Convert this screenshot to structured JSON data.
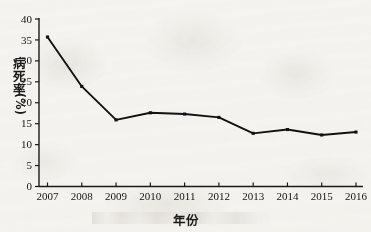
{
  "chart_data": {
    "type": "line",
    "title": "",
    "subtitle": "",
    "xlabel": "年份",
    "ylabel": "病死率(%)",
    "ylabel_chars": [
      "病",
      "死",
      "率"
    ],
    "ylabel_unit": "(%)",
    "categories": [
      "2007",
      "2008",
      "2009",
      "2010",
      "2011",
      "2012",
      "2013",
      "2014",
      "2015",
      "2016"
    ],
    "values": [
      35.7,
      23.9,
      15.9,
      17.6,
      17.3,
      16.5,
      12.7,
      13.6,
      12.3,
      13.0
    ],
    "series": [
      {
        "name": "病死率",
        "values": [
          35.7,
          23.9,
          15.9,
          17.6,
          17.3,
          16.5,
          12.7,
          13.6,
          12.3,
          13.0
        ]
      }
    ],
    "ylim": [
      0,
      40
    ],
    "xlim": [
      "2007",
      "2016"
    ],
    "yticks": [
      0,
      5,
      10,
      15,
      20,
      25,
      30,
      35,
      40
    ],
    "ytick_labels": [
      "0",
      "5",
      "10",
      "15",
      "20",
      "25",
      "30",
      "35",
      "40"
    ],
    "xtick_labels": [
      "2007",
      "2008",
      "2009",
      "2010",
      "2011",
      "2012",
      "2013",
      "2014",
      "2015",
      "2016"
    ],
    "grid": false,
    "legend": false,
    "legend_position": "none",
    "marker": "square",
    "line_color": "#111111",
    "marker_color": "#111111",
    "axis_color": "#1a1a1a",
    "background_color": "#f7f6f3",
    "annotations": []
  },
  "figure": {
    "axis_spines": [
      "left",
      "bottom"
    ],
    "tick_direction": "out"
  }
}
